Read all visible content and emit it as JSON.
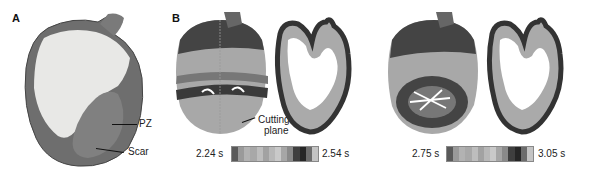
{
  "figure": {
    "panels": [
      {
        "label": "A",
        "annotations": [
          {
            "text": "PZ"
          },
          {
            "text": "Scar"
          }
        ]
      },
      {
        "label": "B",
        "annotations": [
          {
            "text": "Cutting"
          },
          {
            "text": "plane"
          }
        ],
        "colorbars": [
          {
            "min_label": "2.24 s",
            "max_label": "2.54 s",
            "steps": [
              "#5a5a5a",
              "#9a9a9a",
              "#b2b2b2",
              "#a8a8a8",
              "#bdbdbd",
              "#a2a2a2",
              "#b8b8b8",
              "#c9c9c9",
              "#a6a6a6",
              "#8a8a8a",
              "#3f3f3f",
              "#262626",
              "#6c6c6c",
              "#c4c4c4"
            ]
          },
          {
            "min_label": "2.75 s",
            "max_label": "3.05 s",
            "steps": [
              "#5a5a5a",
              "#9a9a9a",
              "#b2b2b2",
              "#a8a8a8",
              "#bdbdbd",
              "#a2a2a2",
              "#b8b8b8",
              "#c9c9c9",
              "#a6a6a6",
              "#8a8a8a",
              "#3f3f3f",
              "#262626",
              "#6c6c6c",
              "#c4c4c4"
            ]
          }
        ]
      }
    ]
  }
}
